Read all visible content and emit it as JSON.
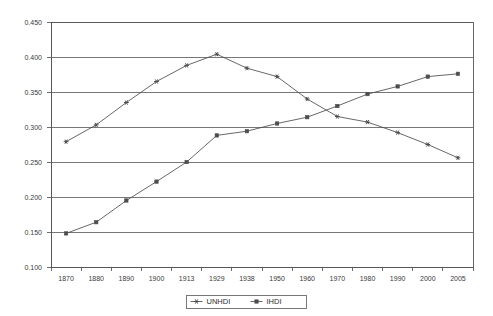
{
  "chart_data": {
    "type": "line",
    "title": "",
    "subtitle": "",
    "xlabel": "",
    "ylabel": "",
    "categories": [
      "1870",
      "1880",
      "1890",
      "1900",
      "1913",
      "1929",
      "1938",
      "1950",
      "1960",
      "1970",
      "1980",
      "1990",
      "2000",
      "2005"
    ],
    "series": [
      {
        "name": "UNHDI",
        "marker": "star",
        "color": "#4d4d4d",
        "values": [
          0.279,
          0.303,
          0.335,
          0.365,
          0.388,
          0.404,
          0.384,
          0.372,
          0.34,
          0.315,
          0.307,
          0.292,
          0.275,
          0.256
        ]
      },
      {
        "name": "IHDI",
        "marker": "square",
        "color": "#4d4d4d",
        "values": [
          0.148,
          0.164,
          0.195,
          0.222,
          0.25,
          0.288,
          0.294,
          0.305,
          0.314,
          0.33,
          0.347,
          0.358,
          0.372,
          0.376
        ]
      }
    ],
    "ylim": [
      0.1,
      0.45
    ],
    "ytick_step": 0.05,
    "ytick_labels": [
      "0.450",
      "0.400",
      "0.350",
      "0.300",
      "0.250",
      "0.200",
      "0.150",
      "0.100"
    ],
    "ytick_values": [
      0.45,
      0.4,
      0.35,
      0.3,
      0.25,
      0.2,
      0.15,
      0.1
    ],
    "grid": true,
    "grid_axis": "y",
    "legend_position": "bottom",
    "legend_entries": [
      "UNHDI",
      "IHDI"
    ]
  }
}
